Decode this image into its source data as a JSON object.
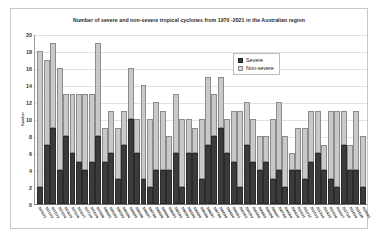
{
  "chart_data": {
    "type": "bar",
    "subtype": "stacked",
    "title": "Number of severe and non-severe tropical cyclones from  1970 -2021 in the Australian region",
    "xlabel": "",
    "ylabel": "Number",
    "ylim": [
      0,
      20
    ],
    "ytick_step": 2,
    "yticks": [
      0,
      2,
      4,
      6,
      8,
      10,
      12,
      14,
      16,
      18,
      20
    ],
    "grid": true,
    "legend_position": "top-right",
    "legend": [
      "Severe",
      "Non-severe"
    ],
    "colors": {
      "severe": "#3b3b3b",
      "non_severe": "#c9c9c9",
      "gridline": "#e2e2e2",
      "axis": "#6e6e6e",
      "frame": "#c8c8c8",
      "background": "#ffffff"
    },
    "categories": [
      "1970/71",
      "1971/72",
      "1972/73",
      "1973/74",
      "1974/75",
      "1975/76",
      "1976/77",
      "1977/78",
      "1978/79",
      "1979/80",
      "1980/81",
      "1981/82",
      "1982/83",
      "1983/84",
      "1984/85",
      "1985/86",
      "1986/87",
      "1987/88",
      "1988/89",
      "1989/90",
      "1990/91",
      "1991/92",
      "1992/93",
      "1993/94",
      "1994/95",
      "1995/96",
      "1996/97",
      "1997/98",
      "1998/99",
      "1999/00",
      "2000/01",
      "2001/02",
      "2002/03",
      "2003/04",
      "2004/05",
      "2005/06",
      "2006/07",
      "2007/08",
      "2008/09",
      "2009/10",
      "2010/11",
      "2011/12",
      "2012/13",
      "2013/14",
      "2014/15",
      "2015/16",
      "2016/17",
      "2017/18",
      "2018/19",
      "2019/20",
      "2020/21"
    ],
    "series": [
      {
        "name": "Severe",
        "values": [
          2,
          7,
          9,
          4,
          8,
          6,
          5,
          4,
          5,
          8,
          5,
          6,
          3,
          7,
          10,
          6,
          3,
          2,
          4,
          4,
          4,
          6,
          2,
          6,
          6,
          3,
          7,
          8,
          9,
          6,
          5,
          2,
          7,
          5,
          4,
          5,
          3,
          4,
          2,
          4,
          4,
          3,
          5,
          6,
          4,
          3,
          2,
          7,
          4,
          4,
          2
        ]
      },
      {
        "name": "Non-severe",
        "values": [
          16,
          10,
          10,
          12,
          5,
          7,
          8,
          9,
          8,
          11,
          4,
          5,
          6,
          4,
          6,
          4,
          11,
          8,
          8,
          7,
          4,
          7,
          8,
          4,
          3,
          7,
          8,
          5,
          6,
          4,
          6,
          9,
          5,
          5,
          4,
          3,
          7,
          8,
          6,
          2,
          5,
          6,
          6,
          5,
          3,
          8,
          9,
          4,
          3,
          7,
          6
        ]
      }
    ],
    "totals": [
      18,
      17,
      19,
      16,
      13,
      13,
      13,
      13,
      13,
      19,
      9,
      11,
      9,
      11,
      16,
      10,
      14,
      10,
      12,
      11,
      8,
      13,
      10,
      10,
      9,
      10,
      15,
      13,
      15,
      10,
      11,
      11,
      12,
      10,
      8,
      8,
      10,
      12,
      8,
      6,
      9,
      9,
      11,
      11,
      7,
      11,
      11,
      11,
      7,
      11,
      8
    ]
  }
}
